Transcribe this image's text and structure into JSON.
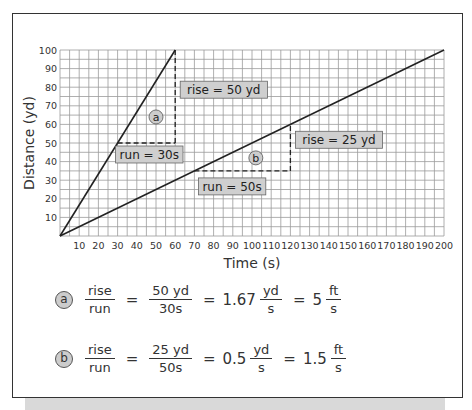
{
  "chart_data": {
    "type": "line",
    "title": "",
    "xlabel": "Time (s)",
    "ylabel": "Distance (yd)",
    "xlim": [
      0,
      200
    ],
    "ylim": [
      0,
      100
    ],
    "x_ticks": [
      10,
      20,
      30,
      40,
      50,
      60,
      70,
      80,
      90,
      100,
      110,
      120,
      130,
      140,
      150,
      160,
      170,
      180,
      190,
      200
    ],
    "y_ticks": [
      10,
      20,
      30,
      40,
      50,
      60,
      70,
      80,
      90,
      100
    ],
    "grid": true,
    "grid_minor_step": 5,
    "series": [
      {
        "name": "a",
        "x": [
          0,
          60
        ],
        "y": [
          0,
          100
        ],
        "slope_yd_per_s": 1.67
      },
      {
        "name": "b",
        "x": [
          0,
          200
        ],
        "y": [
          0,
          100
        ],
        "slope_yd_per_s": 0.5
      }
    ],
    "annotations": [
      {
        "series": "a",
        "type": "rise-run",
        "run_from": [
          30,
          50
        ],
        "run_to": [
          60,
          50
        ],
        "rise_to": [
          60,
          100
        ],
        "rise_label": "rise = 50 yd",
        "run_label": "run = 30s",
        "marker": "a"
      },
      {
        "series": "b",
        "type": "rise-run",
        "run_from": [
          70,
          35
        ],
        "run_to": [
          120,
          35
        ],
        "rise_to": [
          120,
          60
        ],
        "rise_label": "rise = 25 yd",
        "run_label": "run = 50s",
        "marker": "b"
      }
    ]
  },
  "equations": [
    {
      "marker": "a",
      "lhs_num": "rise",
      "lhs_den": "run",
      "mid_num": "50 yd",
      "mid_den": "30s",
      "v1_coef": "1.67",
      "v1_num": "yd",
      "v1_den": "s",
      "v2_coef": "5",
      "v2_num": "ft",
      "v2_den": "s",
      "eq": "="
    },
    {
      "marker": "b",
      "lhs_num": "rise",
      "lhs_den": "run",
      "mid_num": "25 yd",
      "mid_den": "50s",
      "v1_coef": "0.5",
      "v1_num": "yd",
      "v1_den": "s",
      "v2_coef": "1.5",
      "v2_num": "ft",
      "v2_den": "s",
      "eq": "="
    }
  ],
  "colors": {
    "grid": "#9a9a9a",
    "line": "#222222",
    "label_box": "#cfcfcf",
    "badge": "#cccccc",
    "shadow": "#d9d9d9"
  }
}
